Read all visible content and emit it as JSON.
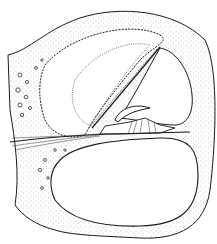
{
  "figure": {
    "colors": {
      "background": "#ffffff",
      "ink": "#1a1a1a",
      "stipple": "#777777"
    }
  }
}
